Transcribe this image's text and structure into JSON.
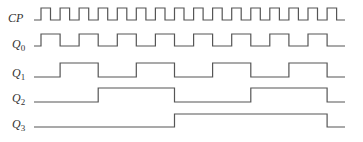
{
  "diagram": {
    "type": "timing-diagram",
    "start_x": 34,
    "first_edge_x": 41,
    "period": 19.07,
    "end_x": 345,
    "stroke_color": "#555555",
    "signals": [
      {
        "name": "CP",
        "label": "CP",
        "sub": "",
        "y_low": 20,
        "y_high": 8,
        "kind": "clock",
        "cycles": 16
      },
      {
        "name": "Q0",
        "label": "Q",
        "sub": "0",
        "y_low": 46,
        "y_high": 34,
        "kind": "divided",
        "divide": 2,
        "invert": false
      },
      {
        "name": "Q1",
        "label": "Q",
        "sub": "1",
        "y_low": 77,
        "y_high": 63,
        "kind": "divided",
        "divide": 4,
        "invert": false
      },
      {
        "name": "Q2",
        "label": "Q",
        "sub": "2",
        "y_low": 102,
        "y_high": 88,
        "kind": "divided",
        "divide": 8,
        "invert": false
      },
      {
        "name": "Q3",
        "label": "Q",
        "sub": "3",
        "y_low": 127,
        "y_high": 114,
        "kind": "divided",
        "divide": 16,
        "invert": false
      }
    ]
  }
}
